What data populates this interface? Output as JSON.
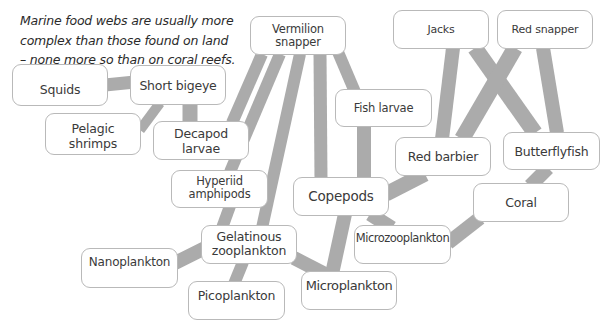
{
  "caption": {
    "line1": "Marine food webs are usually more",
    "line2": "complex than those found on land",
    "line3": "– none more so than on coral reefs."
  },
  "edge_color": "#ababab",
  "nodes": {
    "squids": {
      "label": "Squids"
    },
    "short_bigeye": {
      "label": "Short bigeye"
    },
    "pelagic_shrimps": {
      "label": "Pelagic shrimps"
    },
    "decapod_larvae": {
      "label": "Decapod larvae"
    },
    "vermilion_snapper": {
      "line1": "Vermilion",
      "line2": "snapper"
    },
    "fish_larvae": {
      "label": "Fish larvae"
    },
    "jacks": {
      "label": "Jacks"
    },
    "red_snapper": {
      "label": "Red snapper"
    },
    "red_barbier": {
      "label": "Red barbier"
    },
    "butterflyfish": {
      "label": "Butterflyfish"
    },
    "hyperiid_amphipods": {
      "line1": "Hyperiid",
      "line2": "amphipods"
    },
    "copepods": {
      "label": "Copepods"
    },
    "coral": {
      "label": "Coral"
    },
    "microzooplankton": {
      "label": "Microzooplankton"
    },
    "gelatinous_zooplankton": {
      "line1": "Gelatinous",
      "line2": "zooplankton"
    },
    "nanoplankton": {
      "label": "Nanoplankton"
    },
    "picoplankton": {
      "label": "Picoplankton"
    },
    "microplankton": {
      "label": "Microplankton"
    }
  },
  "edges": [
    [
      "Squids",
      "Short bigeye"
    ],
    [
      "Short bigeye",
      "Pelagic shrimps"
    ],
    [
      "Short bigeye",
      "Decapod larvae"
    ],
    [
      "Vermilion snapper",
      "Decapod larvae"
    ],
    [
      "Vermilion snapper",
      "Hyperiid amphipods"
    ],
    [
      "Vermilion snapper",
      "Gelatinous zooplankton"
    ],
    [
      "Vermilion snapper",
      "Picoplankton"
    ],
    [
      "Vermilion snapper",
      "Copepods"
    ],
    [
      "Vermilion snapper",
      "Fish larvae"
    ],
    [
      "Fish larvae",
      "Copepods"
    ],
    [
      "Jacks",
      "Red barbier"
    ],
    [
      "Jacks",
      "Butterflyfish"
    ],
    [
      "Red snapper",
      "Red barbier"
    ],
    [
      "Red snapper",
      "Butterflyfish"
    ],
    [
      "Red barbier",
      "Copepods"
    ],
    [
      "Butterflyfish",
      "Coral"
    ],
    [
      "Coral",
      "Microzooplankton"
    ],
    [
      "Copepods",
      "Microzooplankton"
    ],
    [
      "Copepods",
      "Microplankton"
    ],
    [
      "Gelatinous zooplankton",
      "Nanoplankton"
    ],
    [
      "Gelatinous zooplankton",
      "Microplankton"
    ]
  ]
}
